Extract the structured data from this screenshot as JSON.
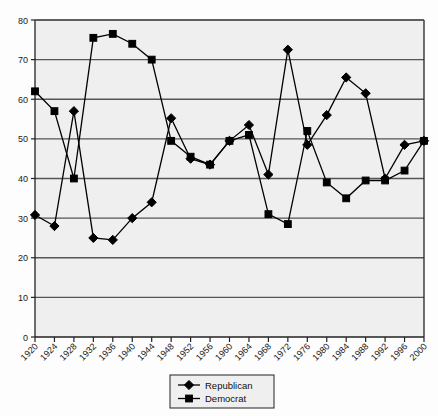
{
  "chart_data": {
    "type": "line",
    "title": "",
    "subtitle": "",
    "xlabel": "",
    "ylabel": "",
    "categories": [
      "1920",
      "1924",
      "1928",
      "1932",
      "1936",
      "1940",
      "1944",
      "1948",
      "1952",
      "1956",
      "1960",
      "1964",
      "1968",
      "1972",
      "1976",
      "1980",
      "1984",
      "1988",
      "1992",
      "1996",
      "2000"
    ],
    "xlim": [
      1920,
      2000
    ],
    "ylim": [
      0,
      80
    ],
    "ytick_values": [
      0,
      10,
      20,
      30,
      40,
      50,
      60,
      70,
      80
    ],
    "ytick_labels": [
      "0",
      "10",
      "20",
      "30",
      "40",
      "50",
      "60",
      "70",
      "80"
    ],
    "grid": "horizontal",
    "legend_position": "bottom-center",
    "series": [
      {
        "name": "Republican",
        "marker": "diamond",
        "color": "#000000",
        "values": [
          30.8,
          28.0,
          57.0,
          25.0,
          24.5,
          30.0,
          34.0,
          55.2,
          45.0,
          43.5,
          49.5,
          53.5,
          41.0,
          72.5,
          48.5,
          56.0,
          65.5,
          61.5,
          40.0,
          48.5,
          49.5
        ]
      },
      {
        "name": "Democrat",
        "marker": "square",
        "color": "#000000",
        "values": [
          62.0,
          57.0,
          40.0,
          75.5,
          76.5,
          74.0,
          70.0,
          49.5,
          45.5,
          43.5,
          49.5,
          51.0,
          31.0,
          28.5,
          52.0,
          39.0,
          35.0,
          39.5,
          39.5,
          42.0,
          49.5
        ]
      }
    ]
  },
  "legend": {
    "items": [
      {
        "label": "Republican",
        "marker": "diamond"
      },
      {
        "label": "Democrat",
        "marker": "square"
      }
    ]
  }
}
